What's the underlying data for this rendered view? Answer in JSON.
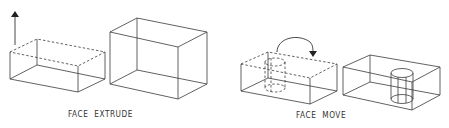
{
  "figure": {
    "panels": [
      {
        "id": "face-extrude",
        "caption": "FACE  EXTRUDE",
        "elements": [
          "flat box with dashed top face",
          "upward arrow indicating extrusion direction",
          "taller extruded box"
        ]
      },
      {
        "id": "face-move",
        "caption": "FACE  MOVE",
        "elements": [
          "box with dashed cylindrical hole near left",
          "curved arrow showing move of cylindrical face",
          "box with cylindrical hole moved to center-right"
        ]
      }
    ],
    "colors": {
      "line": "#3a3a3a",
      "background": "#ffffff",
      "text": "#333333"
    }
  }
}
